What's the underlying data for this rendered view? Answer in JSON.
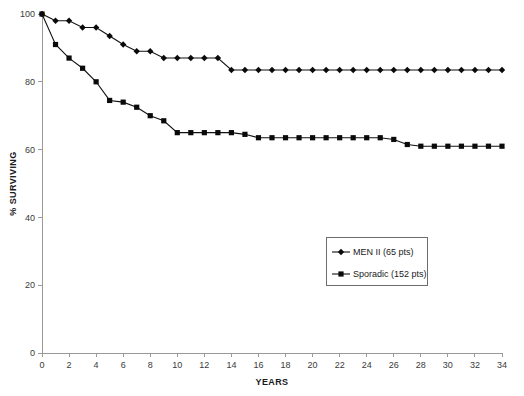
{
  "chart_data": {
    "type": "line",
    "title": "",
    "xlabel": "YEARS",
    "ylabel": "% SURVIVING",
    "xlim": [
      0,
      34
    ],
    "ylim": [
      0,
      100
    ],
    "xticks": [
      0,
      2,
      4,
      6,
      8,
      10,
      12,
      14,
      16,
      18,
      20,
      22,
      24,
      26,
      28,
      30,
      32,
      34
    ],
    "yticks": [
      0,
      20,
      40,
      60,
      80,
      100
    ],
    "xtick_labels": [
      "0",
      "2",
      "4",
      "6",
      "8",
      "10",
      "12",
      "14",
      "16",
      "18",
      "20",
      "22",
      "24",
      "26",
      "28",
      "30",
      "32",
      "34"
    ],
    "ytick_labels": [
      "0",
      "20",
      "40",
      "60",
      "80",
      "100"
    ],
    "grid": false,
    "legend_position": "center-right",
    "series": [
      {
        "name": "MEN II (65 pts)",
        "marker": "diamond",
        "color": "#111111",
        "x": [
          0,
          1,
          2,
          3,
          4,
          5,
          6,
          7,
          8,
          9,
          10,
          11,
          12,
          13,
          14,
          15,
          16,
          17,
          18,
          19,
          20,
          21,
          22,
          23,
          24,
          25,
          26,
          27,
          28,
          29,
          30,
          31,
          32,
          33,
          34
        ],
        "values": [
          100,
          98,
          98,
          96,
          96,
          93.5,
          91,
          89,
          89,
          87,
          87,
          87,
          87,
          87,
          83.5,
          83.5,
          83.5,
          83.5,
          83.5,
          83.5,
          83.5,
          83.5,
          83.5,
          83.5,
          83.5,
          83.5,
          83.5,
          83.5,
          83.5,
          83.5,
          83.5,
          83.5,
          83.5,
          83.5,
          83.5
        ]
      },
      {
        "name": "Sporadic (152 pts)",
        "marker": "square",
        "color": "#111111",
        "x": [
          0,
          1,
          2,
          3,
          4,
          5,
          6,
          7,
          8,
          9,
          10,
          11,
          12,
          13,
          14,
          15,
          16,
          17,
          18,
          19,
          20,
          21,
          22,
          23,
          24,
          25,
          26,
          27,
          28,
          29,
          30,
          31,
          32,
          33,
          34
        ],
        "values": [
          100,
          91,
          87,
          84,
          80,
          74.5,
          74,
          72.5,
          70,
          68.5,
          65,
          65,
          65,
          65,
          65,
          64.5,
          63.5,
          63.5,
          63.5,
          63.5,
          63.5,
          63.5,
          63.5,
          63.5,
          63.5,
          63.5,
          63,
          61.5,
          61,
          61,
          61,
          61,
          61,
          61,
          61
        ]
      }
    ],
    "legend": [
      {
        "label": "MEN II (65 pts)",
        "marker": "diamond"
      },
      {
        "label": "Sporadic (152 pts)",
        "marker": "square"
      }
    ]
  }
}
